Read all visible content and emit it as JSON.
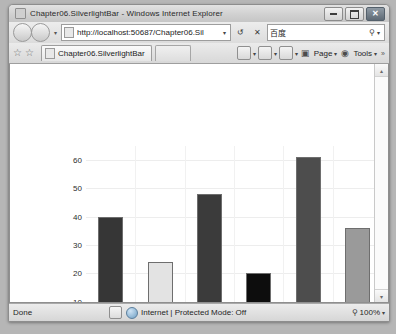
{
  "window": {
    "title": "Chapter06.SilverlightBar - Windows Internet Explorer",
    "minimize_label": "–",
    "maximize_label": "",
    "close_label": "✕"
  },
  "navbar": {
    "back_label": "",
    "forward_label": "",
    "history_caret": "▾",
    "address_value": "http://localhost:50687/Chapter06.Sil",
    "address_caret": "▾",
    "refresh_label": "↺",
    "stop_label": "✕",
    "search_value": "百度",
    "search_placeholder": "Search",
    "search_glass": "⚲",
    "search_caret": "▾"
  },
  "cmdbar": {
    "favorites_star": "☆",
    "add_favorite": "☆",
    "tab_label": "Chapter06.SilverlightBar",
    "home_caret": "▾",
    "feeds_caret": "▾",
    "print_caret": "▾",
    "page_label": "Page",
    "page_caret": "▾",
    "tools_label": "Tools",
    "tools_caret": "▾",
    "overflow_label": "»"
  },
  "scrollbar": {
    "up_arrow": "▴",
    "down_arrow": "▾"
  },
  "statusbar": {
    "status_text": "Done",
    "zone_text": "Internet | Protected Mode: Off",
    "zoom_glass": "⚲",
    "zoom_level": "100%",
    "zoom_caret": "▾"
  },
  "chart_data": {
    "type": "bar",
    "title": "",
    "xlabel": "",
    "ylabel": "",
    "categories": [
      "Jan",
      "Feb",
      "Mar",
      "Apr",
      "May",
      "Jun"
    ],
    "values": [
      40,
      24,
      48,
      20,
      61,
      36
    ],
    "colors": [
      "#363636",
      "#e3e3e3",
      "#3b3b3b",
      "#0d0d0d",
      "#4d4d4d",
      "#9a9a9a"
    ],
    "ylim": [
      0,
      65
    ],
    "yticks": [
      0,
      10,
      20,
      30,
      40,
      50,
      60
    ],
    "ytick_labels": [
      "0",
      "10",
      "20",
      "30",
      "40",
      "50",
      "60"
    ],
    "grid": true,
    "legend": false
  }
}
